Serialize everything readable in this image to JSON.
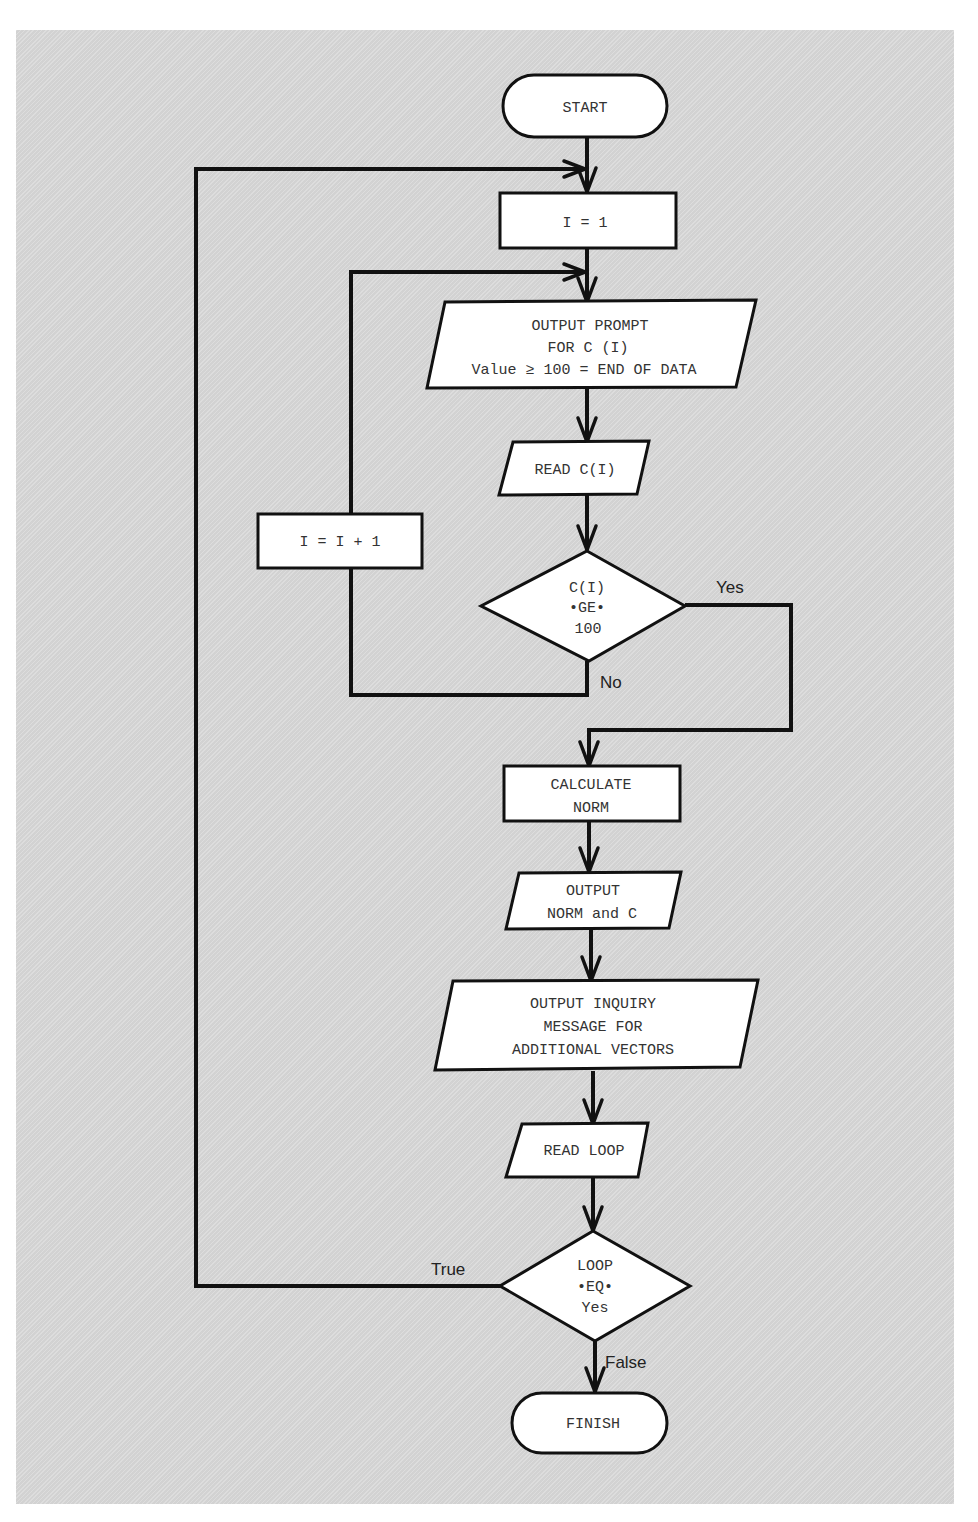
{
  "diagram": {
    "type": "flowchart",
    "colors": {
      "background": "#d9d9d9",
      "shape_fill": "#ffffff",
      "stroke": "#111111",
      "text": "#333333"
    },
    "nodes": {
      "start": {
        "shape": "terminator",
        "lines": [
          "START"
        ]
      },
      "init_i": {
        "shape": "process",
        "lines": [
          "I = 1"
        ]
      },
      "prompt": {
        "shape": "io",
        "lines": [
          "OUTPUT PROMPT",
          "FOR C (I)",
          "Value ≥ 100 = END OF DATA"
        ]
      },
      "read_c": {
        "shape": "io",
        "lines": [
          "READ C(I)"
        ]
      },
      "incr_i": {
        "shape": "process",
        "lines": [
          "I = I + 1"
        ]
      },
      "test_c": {
        "shape": "decision",
        "lines": [
          "C(I)",
          "•GE•",
          "100"
        ]
      },
      "calc": {
        "shape": "process",
        "lines": [
          "CALCULATE",
          "NORM"
        ]
      },
      "out_norm": {
        "shape": "io",
        "lines": [
          "OUTPUT",
          "NORM and C"
        ]
      },
      "inquiry": {
        "shape": "io",
        "lines": [
          "OUTPUT INQUIRY",
          "MESSAGE FOR",
          "ADDITIONAL VECTORS"
        ]
      },
      "read_loop": {
        "shape": "io",
        "lines": [
          "READ LOOP"
        ]
      },
      "test_loop": {
        "shape": "decision",
        "lines": [
          "LOOP",
          "•EQ•",
          "Yes"
        ]
      },
      "finish": {
        "shape": "terminator",
        "lines": [
          "FINISH"
        ]
      }
    },
    "edges": [
      {
        "from": "start",
        "to": "init_i"
      },
      {
        "from": "init_i",
        "to": "prompt"
      },
      {
        "from": "prompt",
        "to": "read_c"
      },
      {
        "from": "read_c",
        "to": "test_c"
      },
      {
        "from": "test_c",
        "to": "incr_i",
        "label": "No"
      },
      {
        "from": "incr_i",
        "to": "prompt"
      },
      {
        "from": "test_c",
        "to": "calc",
        "label": "Yes"
      },
      {
        "from": "calc",
        "to": "out_norm"
      },
      {
        "from": "out_norm",
        "to": "inquiry"
      },
      {
        "from": "inquiry",
        "to": "read_loop"
      },
      {
        "from": "read_loop",
        "to": "test_loop"
      },
      {
        "from": "test_loop",
        "to": "init_i",
        "label": "True"
      },
      {
        "from": "test_loop",
        "to": "finish",
        "label": "False"
      }
    ],
    "edge_labels": {
      "yes": "Yes",
      "no": "No",
      "true": "True",
      "false": "False"
    }
  }
}
